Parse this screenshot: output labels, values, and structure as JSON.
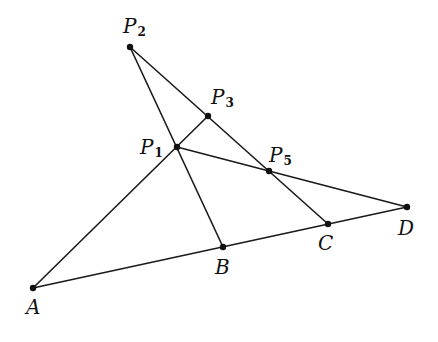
{
  "diagram": {
    "points": [
      {
        "id": "A",
        "name": "A",
        "sub": "",
        "x": 33,
        "y": 288,
        "lx": 26,
        "ly": 314
      },
      {
        "id": "B",
        "name": "B",
        "sub": "",
        "x": 223,
        "y": 247,
        "lx": 215,
        "ly": 274
      },
      {
        "id": "C",
        "name": "C",
        "sub": "",
        "x": 328,
        "y": 224,
        "lx": 318,
        "ly": 250
      },
      {
        "id": "D",
        "name": "D",
        "sub": "",
        "x": 407,
        "y": 207,
        "lx": 398,
        "ly": 235
      },
      {
        "id": "P1",
        "name": "P",
        "sub": "1",
        "x": 177,
        "y": 147,
        "lx": 140,
        "ly": 154
      },
      {
        "id": "P2",
        "name": "P",
        "sub": "2",
        "x": 130,
        "y": 47,
        "lx": 123,
        "ly": 33
      },
      {
        "id": "P3",
        "name": "P",
        "sub": "3",
        "x": 208,
        "y": 116,
        "lx": 211,
        "ly": 104
      },
      {
        "id": "P5",
        "name": "P",
        "sub": "5",
        "x": 269,
        "y": 171,
        "lx": 269,
        "ly": 162
      }
    ],
    "segments": [
      {
        "from": "A",
        "to": "P3"
      },
      {
        "from": "P2",
        "to": "B"
      },
      {
        "from": "P2",
        "to": "C"
      },
      {
        "from": "P1",
        "to": "D"
      },
      {
        "from": "A",
        "to": "D"
      }
    ],
    "colors": {
      "line": "#1a1a1a",
      "point": "#111111",
      "background": "#ffffff"
    }
  }
}
